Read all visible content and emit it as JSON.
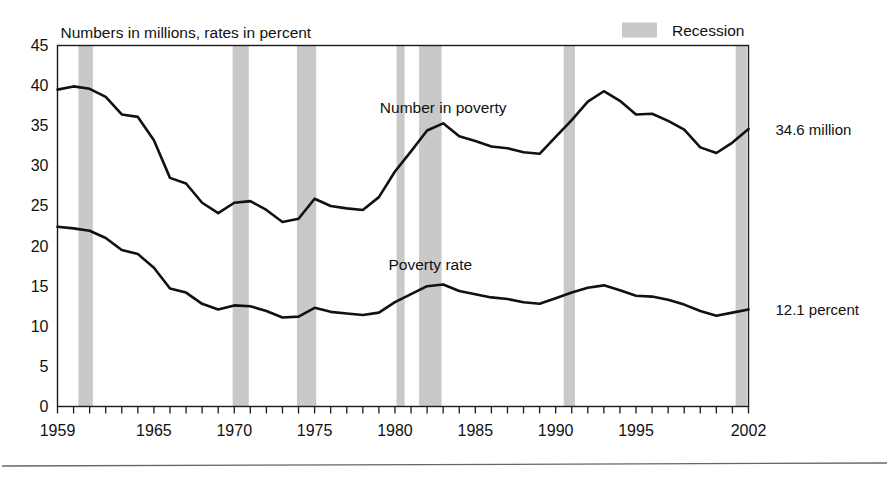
{
  "figure": {
    "title": "Numbers in millions, rates in percent",
    "legend_label": "Recession",
    "legend_swatch_color": "#c9c9c9",
    "line_color": "#111111",
    "band_color": "#c9c9c9",
    "end_label_number": "34.6 million",
    "end_label_rate": "12.1 percent",
    "series_label_number": "Number in poverty",
    "series_label_rate": "Poverty rate"
  },
  "chart_data": {
    "type": "line",
    "title": "Numbers in millions, rates in percent",
    "xlabel": "",
    "ylabel": "",
    "xlim": [
      1959,
      2002
    ],
    "ylim": [
      0,
      45
    ],
    "ytick_values": [
      0,
      5,
      10,
      15,
      20,
      25,
      30,
      35,
      40,
      45
    ],
    "ytick_labels": [
      "0",
      "5",
      "10",
      "15",
      "20",
      "25",
      "30",
      "35",
      "40",
      "45"
    ],
    "xtick_labels": [
      "1959",
      "1965",
      "1970",
      "1975",
      "1980",
      "1985",
      "1990",
      "1995",
      "2002"
    ],
    "xtick_values": [
      1959,
      1965,
      1970,
      1975,
      1980,
      1985,
      1990,
      1995,
      2002
    ],
    "minor_xticks_every": 1,
    "grid": false,
    "legend_position": "top-right",
    "x": [
      1959,
      1960,
      1961,
      1962,
      1963,
      1964,
      1965,
      1966,
      1967,
      1968,
      1969,
      1970,
      1971,
      1972,
      1973,
      1974,
      1975,
      1976,
      1977,
      1978,
      1979,
      1980,
      1981,
      1982,
      1983,
      1984,
      1985,
      1986,
      1987,
      1988,
      1989,
      1990,
      1991,
      1992,
      1993,
      1994,
      1995,
      1996,
      1997,
      1998,
      1999,
      2000,
      2001,
      2002
    ],
    "series": [
      {
        "name": "Number in poverty",
        "units": "millions",
        "end_value": 34.6,
        "values": [
          39.5,
          39.9,
          39.6,
          38.6,
          36.4,
          36.1,
          33.2,
          28.5,
          27.8,
          25.4,
          24.1,
          25.4,
          25.6,
          24.5,
          23.0,
          23.4,
          25.9,
          25.0,
          24.7,
          24.5,
          26.1,
          29.3,
          31.8,
          34.4,
          35.3,
          33.7,
          33.1,
          32.4,
          32.2,
          31.7,
          31.5,
          33.6,
          35.7,
          38.0,
          39.3,
          38.1,
          36.4,
          36.5,
          35.6,
          34.5,
          32.3,
          31.6,
          32.9,
          34.6
        ]
      },
      {
        "name": "Poverty rate",
        "units": "percent",
        "end_value": 12.1,
        "values": [
          22.4,
          22.2,
          21.9,
          21.0,
          19.5,
          19.0,
          17.3,
          14.7,
          14.2,
          12.8,
          12.1,
          12.6,
          12.5,
          11.9,
          11.1,
          11.2,
          12.3,
          11.8,
          11.6,
          11.4,
          11.7,
          13.0,
          14.0,
          15.0,
          15.2,
          14.4,
          14.0,
          13.6,
          13.4,
          13.0,
          12.8,
          13.5,
          14.2,
          14.8,
          15.1,
          14.5,
          13.8,
          13.7,
          13.3,
          12.7,
          11.9,
          11.3,
          11.7,
          12.1
        ]
      }
    ],
    "recession_bands": [
      {
        "start": 1960.3,
        "end": 1961.2
      },
      {
        "start": 1969.9,
        "end": 1970.9
      },
      {
        "start": 1973.9,
        "end": 1975.1
      },
      {
        "start": 1980.1,
        "end": 1980.6
      },
      {
        "start": 1981.5,
        "end": 1982.9
      },
      {
        "start": 1990.5,
        "end": 1991.2
      },
      {
        "start": 2001.2,
        "end": 2001.9
      }
    ]
  }
}
